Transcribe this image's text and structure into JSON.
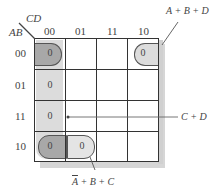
{
  "kmap": {
    "row_var": "AB",
    "col_var": "CD",
    "col_labels": [
      "00",
      "01",
      "11",
      "10"
    ],
    "row_labels": [
      "00",
      "01",
      "11",
      "10"
    ],
    "cells": [
      [
        "0",
        "",
        "",
        "0"
      ],
      [
        "0",
        "",
        "",
        ""
      ],
      [
        "0",
        "",
        "",
        ""
      ],
      [
        "0",
        "0",
        "",
        ""
      ]
    ],
    "groups": [
      {
        "name": "A + B + D",
        "label": "A + B + D"
      },
      {
        "name": "C + D",
        "label": "C + D"
      },
      {
        "name": "A' + B + C",
        "label_overbar": "A",
        "label_rest": " + B + C"
      }
    ]
  },
  "colors": {
    "light_loop": "#dcdcdc",
    "dark_loop": "#a8a8a8",
    "grid_line": "#333333",
    "shadow": "#d6d6d6"
  }
}
